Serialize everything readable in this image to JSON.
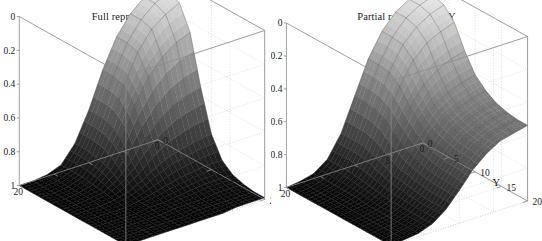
{
  "figure": {
    "background": "#ffffff",
    "panel_count": 2
  },
  "panels": [
    {
      "id": "panel-a",
      "title": "Full repression by Y",
      "caption": "(a)",
      "z_axis_label": "f(X,Y)",
      "x_axis_label": "X",
      "y_axis_label": "Y",
      "z_ticks": [
        "1",
        "0.8",
        "0.6",
        "0.4",
        "0.2",
        "0"
      ],
      "x_ticks": [
        "20",
        "15",
        "10",
        "5",
        "0"
      ],
      "y_ticks": [
        "0",
        "10",
        "20"
      ]
    },
    {
      "id": "panel-b",
      "title": "Partial repression by Y",
      "caption": "(b)",
      "z_axis_label": "",
      "x_axis_label": "X",
      "y_axis_label": "Y",
      "z_ticks": [
        "1",
        "0.8",
        "0.6",
        "0.4",
        "0.2",
        "0"
      ],
      "x_ticks": [
        "20",
        "15",
        "10",
        "5",
        "0"
      ],
      "y_ticks": [
        "0",
        "5",
        "10",
        "15",
        "20"
      ]
    }
  ],
  "chart_data": [
    {
      "type": "surface",
      "panel": "a",
      "title": "Full repression by Y",
      "caption": "(a)",
      "xlabel": "X",
      "ylabel": "Y",
      "zlabel": "f(X,Y)",
      "xlim": [
        0,
        20
      ],
      "ylim": [
        0,
        20
      ],
      "zlim": [
        0,
        1
      ],
      "xticks": [
        0,
        5,
        10,
        15,
        20
      ],
      "yticks": [
        0,
        10,
        20
      ],
      "zticks": [
        0,
        0.2,
        0.4,
        0.6,
        0.8,
        1
      ],
      "grid": true,
      "colormap": "gray",
      "mesh": true,
      "description": "Sigmoidal surface rising from 0 to 1. f is near 0 over most of the X-Y plane and rises sharply to ~1 only for small X and large Y. Full repression: Y fully suppresses output at low Y.",
      "model": "f(X,Y) = (Y^n / (K^n + Y^n)) * (Km^m / (Km^m + X^m)) with n=4, K=11, m=4, Km=7",
      "x": [
        0,
        2,
        4,
        6,
        8,
        10,
        12,
        14,
        16,
        18,
        20
      ],
      "y": [
        0,
        2,
        4,
        6,
        8,
        10,
        12,
        14,
        16,
        18,
        20
      ],
      "z": [
        [
          0.0,
          0.0,
          0.01,
          0.04,
          0.14,
          0.31,
          0.52,
          0.69,
          0.8,
          0.87,
          0.91
        ],
        [
          0.0,
          0.0,
          0.01,
          0.04,
          0.14,
          0.31,
          0.52,
          0.69,
          0.8,
          0.87,
          0.91
        ],
        [
          0.0,
          0.0,
          0.01,
          0.04,
          0.13,
          0.3,
          0.5,
          0.67,
          0.78,
          0.84,
          0.88
        ],
        [
          0.0,
          0.0,
          0.01,
          0.03,
          0.11,
          0.25,
          0.42,
          0.56,
          0.65,
          0.71,
          0.74
        ],
        [
          0.0,
          0.0,
          0.01,
          0.02,
          0.07,
          0.15,
          0.26,
          0.34,
          0.4,
          0.43,
          0.45
        ],
        [
          0.0,
          0.0,
          0.0,
          0.01,
          0.03,
          0.07,
          0.12,
          0.16,
          0.18,
          0.2,
          0.21
        ],
        [
          0.0,
          0.0,
          0.0,
          0.0,
          0.01,
          0.03,
          0.05,
          0.07,
          0.08,
          0.09,
          0.09
        ],
        [
          0.0,
          0.0,
          0.0,
          0.0,
          0.01,
          0.01,
          0.02,
          0.03,
          0.04,
          0.04,
          0.04
        ],
        [
          0.0,
          0.0,
          0.0,
          0.0,
          0.0,
          0.01,
          0.01,
          0.01,
          0.02,
          0.02,
          0.02
        ],
        [
          0.0,
          0.0,
          0.0,
          0.0,
          0.0,
          0.0,
          0.01,
          0.01,
          0.01,
          0.01,
          0.01
        ],
        [
          0.0,
          0.0,
          0.0,
          0.0,
          0.0,
          0.0,
          0.0,
          0.0,
          0.01,
          0.01,
          0.01
        ]
      ]
    },
    {
      "type": "surface",
      "panel": "b",
      "title": "Partial repression by Y",
      "caption": "(b)",
      "xlabel": "X",
      "ylabel": "Y",
      "zlabel": "",
      "xlim": [
        0,
        20
      ],
      "ylim": [
        0,
        20
      ],
      "zlim": [
        0,
        1
      ],
      "xticks": [
        0,
        5,
        10,
        15,
        20
      ],
      "yticks": [
        0,
        5,
        10,
        15,
        20
      ],
      "zticks": [
        0,
        0.2,
        0.4,
        0.6,
        0.8,
        1
      ],
      "grid": true,
      "colormap": "gray",
      "mesh": true,
      "description": "Sigmoidal surface with an intermediate shoulder plateau at z approximately 0.5-0.6 for large X and low Y, rising to ~1 for small X and large Y. Partial repression: Y only partially suppresses output, leaving a residual basal level.",
      "model": "f(X,Y) = (b + (1-b)*Y^n/(K^n+Y^n)) * (Km^m/(Km^m+X^m)) with basal b=0.55",
      "x": [
        0,
        2,
        4,
        6,
        8,
        10,
        12,
        14,
        16,
        18,
        20
      ],
      "y": [
        0,
        2,
        4,
        6,
        8,
        10,
        12,
        14,
        16,
        18,
        20
      ],
      "z": [
        [
          0.0,
          0.01,
          0.03,
          0.09,
          0.22,
          0.42,
          0.62,
          0.76,
          0.85,
          0.9,
          0.93
        ],
        [
          0.0,
          0.01,
          0.03,
          0.09,
          0.22,
          0.42,
          0.62,
          0.76,
          0.85,
          0.9,
          0.93
        ],
        [
          0.0,
          0.01,
          0.03,
          0.09,
          0.22,
          0.41,
          0.61,
          0.75,
          0.83,
          0.88,
          0.91
        ],
        [
          0.0,
          0.01,
          0.03,
          0.08,
          0.2,
          0.38,
          0.56,
          0.69,
          0.77,
          0.81,
          0.84
        ],
        [
          0.0,
          0.01,
          0.03,
          0.07,
          0.17,
          0.32,
          0.47,
          0.58,
          0.64,
          0.68,
          0.7
        ],
        [
          0.0,
          0.01,
          0.02,
          0.06,
          0.14,
          0.27,
          0.4,
          0.49,
          0.54,
          0.57,
          0.59
        ],
        [
          0.0,
          0.01,
          0.02,
          0.05,
          0.13,
          0.24,
          0.35,
          0.44,
          0.48,
          0.51,
          0.53
        ],
        [
          0.0,
          0.01,
          0.02,
          0.05,
          0.12,
          0.22,
          0.33,
          0.41,
          0.45,
          0.48,
          0.49
        ],
        [
          0.0,
          0.01,
          0.02,
          0.05,
          0.11,
          0.21,
          0.31,
          0.39,
          0.43,
          0.46,
          0.47
        ],
        [
          0.0,
          0.01,
          0.02,
          0.05,
          0.11,
          0.21,
          0.31,
          0.38,
          0.42,
          0.45,
          0.46
        ],
        [
          0.0,
          0.01,
          0.02,
          0.05,
          0.11,
          0.2,
          0.3,
          0.37,
          0.42,
          0.44,
          0.46
        ]
      ]
    }
  ]
}
